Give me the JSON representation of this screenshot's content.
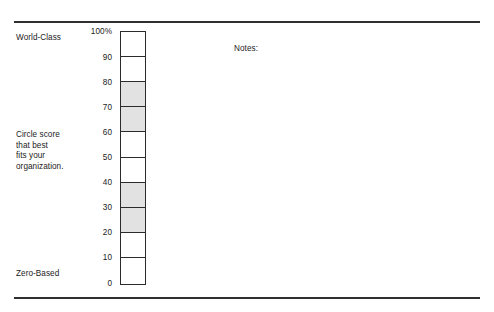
{
  "document": {
    "type": "rating-scale-worksheet",
    "background_color": "#ffffff",
    "rule_color": "#2f2f2f",
    "ink_color": "#1b1b1b",
    "shade_color": "#e2e2e2",
    "border_color": "#2b2b2b"
  },
  "labels": {
    "top": "World-Class",
    "middle": "Circle score\nthat best\nfits your\norganization.",
    "bottom": "Zero-Based"
  },
  "notes": {
    "heading": "Notes:",
    "body": ""
  },
  "chart_data": {
    "type": "bar",
    "title": "",
    "subtitle": "",
    "xlabel": "",
    "ylabel": "",
    "orientation": "vertical",
    "grid": false,
    "legend": null,
    "ylim": [
      0,
      100
    ],
    "tick_labels": [
      "100%",
      "90",
      "80",
      "70",
      "60",
      "50",
      "40",
      "30",
      "20",
      "10",
      "0"
    ],
    "tick_values": [
      100,
      90,
      80,
      70,
      60,
      50,
      40,
      30,
      20,
      10,
      0
    ],
    "categories": [
      "90-100",
      "80-90",
      "70-80",
      "60-70",
      "50-60",
      "40-50",
      "30-40",
      "20-30",
      "10-20",
      "0-10"
    ],
    "cells": [
      {
        "range": "90-100",
        "low": 90,
        "high": 100,
        "shaded": false
      },
      {
        "range": "80-90",
        "low": 80,
        "high": 90,
        "shaded": false
      },
      {
        "range": "70-80",
        "low": 70,
        "high": 80,
        "shaded": true
      },
      {
        "range": "60-70",
        "low": 60,
        "high": 70,
        "shaded": true
      },
      {
        "range": "50-60",
        "low": 50,
        "high": 60,
        "shaded": false
      },
      {
        "range": "40-50",
        "low": 40,
        "high": 50,
        "shaded": false
      },
      {
        "range": "30-40",
        "low": 30,
        "high": 40,
        "shaded": true
      },
      {
        "range": "20-30",
        "low": 20,
        "high": 30,
        "shaded": true
      },
      {
        "range": "10-20",
        "low": 10,
        "high": 20,
        "shaded": false
      },
      {
        "range": "0-10",
        "low": 0,
        "high": 10,
        "shaded": false
      }
    ],
    "values": [
      0,
      0,
      1,
      1,
      0,
      0,
      1,
      1,
      0,
      0
    ],
    "annotations": [
      {
        "text": "World-Class",
        "at": 100,
        "position": "left"
      },
      {
        "text": "Circle score that best fits your organization.",
        "at": 55,
        "position": "left"
      },
      {
        "text": "Zero-Based",
        "at": 0,
        "position": "left"
      }
    ]
  }
}
